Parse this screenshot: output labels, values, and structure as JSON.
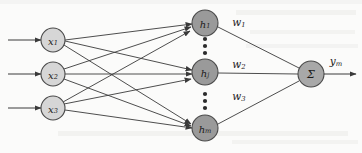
{
  "figure": {
    "background_color": "#fbfbfa",
    "stroke_color": "#3a3a3a",
    "width": 362,
    "height": 153
  },
  "layers": {
    "input": {
      "name": "input-layer",
      "fill_color": "#d6d6d6",
      "radius": 12,
      "nodes": [
        {
          "id": "x1",
          "label": "x",
          "subscript": "1",
          "cx": 53,
          "cy": 40
        },
        {
          "id": "x2",
          "label": "x",
          "subscript": "2",
          "cx": 53,
          "cy": 74
        },
        {
          "id": "x3",
          "label": "x",
          "subscript": "3",
          "cx": 53,
          "cy": 108
        }
      ]
    },
    "hidden": {
      "name": "hidden-layer",
      "fill_color": "#9a9a9a",
      "radius": 13,
      "nodes": [
        {
          "id": "h1",
          "label": "h",
          "subscript": "1",
          "cx": 205,
          "cy": 23
        },
        {
          "id": "hj",
          "label": "h",
          "subscript": "j",
          "cx": 205,
          "cy": 72
        },
        {
          "id": "hm",
          "label": "h",
          "subscript": "m",
          "cx": 205,
          "cy": 128
        }
      ],
      "ellipses": [
        {
          "id": "ellipsis-upper",
          "cx": 205,
          "dots_y": [
            39,
            46,
            53
          ]
        },
        {
          "id": "ellipsis-lower",
          "cx": 205,
          "dots_y": [
            94,
            101,
            108
          ]
        }
      ]
    },
    "output": {
      "name": "output-layer",
      "fill_color": "#a8a8a8",
      "radius": 13,
      "node": {
        "id": "sum",
        "label": "Σ",
        "cx": 311,
        "cy": 74
      }
    }
  },
  "weights": [
    {
      "id": "w1",
      "label": "w",
      "subscript": "1",
      "x": 239,
      "y": 22
    },
    {
      "id": "w2",
      "label": "w",
      "subscript": "2",
      "x": 239,
      "y": 64
    },
    {
      "id": "w3",
      "label": "w",
      "subscript": "3",
      "x": 239,
      "y": 96
    }
  ],
  "output_signal": {
    "id": "ym",
    "label": "y",
    "subscript": "m",
    "x": 336,
    "y": 61,
    "arrow_from_x": 324,
    "arrow_to_x": 356,
    "arrow_y": 74
  },
  "input_arrows": [
    {
      "id": "input-arrow-1",
      "from_x": 8,
      "to_x": 41,
      "y": 40
    },
    {
      "id": "input-arrow-2",
      "from_x": 8,
      "to_x": 41,
      "y": 74
    },
    {
      "id": "input-arrow-3",
      "from_x": 8,
      "to_x": 41,
      "y": 108
    }
  ],
  "connections": {
    "input_to_hidden": [
      {
        "from": "x1",
        "to": "h1"
      },
      {
        "from": "x1",
        "to": "hj"
      },
      {
        "from": "x1",
        "to": "hm"
      },
      {
        "from": "x2",
        "to": "h1"
      },
      {
        "from": "x2",
        "to": "hj"
      },
      {
        "from": "x2",
        "to": "hm"
      },
      {
        "from": "x3",
        "to": "h1"
      },
      {
        "from": "x3",
        "to": "hj"
      },
      {
        "from": "x3",
        "to": "hm"
      }
    ],
    "hidden_to_output": [
      {
        "from": "h1",
        "to": "sum",
        "weight": "w1"
      },
      {
        "from": "hj",
        "to": "sum",
        "weight": "w2"
      },
      {
        "from": "hm",
        "to": "sum",
        "weight": "w3"
      }
    ]
  }
}
